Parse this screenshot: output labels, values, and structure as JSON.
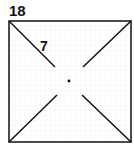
{
  "diagram": {
    "puzzle_number": "18",
    "segment_label": "7",
    "grid_color": "#e6e6e6",
    "line_color": "#111111"
  }
}
